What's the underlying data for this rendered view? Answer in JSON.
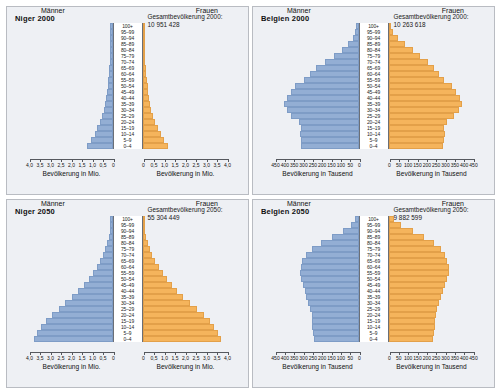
{
  "panels": [
    {
      "id": "niger-2000",
      "title": "Niger 2000",
      "total_label": "Gesamtbevölkerung 2000:\n10 951 428",
      "male_label": "Männer",
      "female_label": "Frauen",
      "axis_title": "Bevölkerung in Mio.",
      "unit": "Mio.",
      "axis_max": 4.0,
      "ticks": [
        "4,0",
        "3,5",
        "3,0",
        "2,5",
        "2,0",
        "1,5",
        "1,0",
        "0,5",
        "0"
      ],
      "tick_values": [
        4.0,
        3.5,
        3.0,
        2.5,
        2.0,
        1.5,
        1.0,
        0.5,
        0
      ]
    },
    {
      "id": "belgien-2000",
      "title": "Belgien 2000",
      "total_label": "Gesamtbevölkerung 2000:\n10 263 618",
      "male_label": "Männer",
      "female_label": "Frauen",
      "axis_title": "Bevölkerung in Tausend",
      "unit": "Tausend",
      "axis_max": 450,
      "ticks": [
        "450",
        "400",
        "350",
        "300",
        "250",
        "200",
        "150",
        "100",
        "50",
        "0"
      ],
      "tick_values": [
        450,
        400,
        350,
        300,
        250,
        200,
        150,
        100,
        50,
        0
      ]
    },
    {
      "id": "niger-2050",
      "title": "Niger 2050",
      "total_label": "Gesamtbevölkerung 2050:\n55 304 449",
      "male_label": "Männer",
      "female_label": "Frauen",
      "axis_title": "Bevölkerung in Mio.",
      "unit": "Mio.",
      "axis_max": 4.0,
      "ticks": [
        "4,0",
        "3,5",
        "3,0",
        "2,5",
        "2,0",
        "1,5",
        "1,0",
        "0,5",
        "0"
      ],
      "tick_values": [
        4.0,
        3.5,
        3.0,
        2.5,
        2.0,
        1.5,
        1.0,
        0.5,
        0
      ]
    },
    {
      "id": "belgien-2050",
      "title": "Belgien 2050",
      "total_label": "Gesamtbevölkerung 2050:\n9 882 599",
      "male_label": "Männer",
      "female_label": "Frauen",
      "axis_title": "Bevölkerung in Tausend",
      "unit": "Tausend",
      "axis_max": 450,
      "ticks": [
        "450",
        "400",
        "350",
        "300",
        "250",
        "200",
        "150",
        "100",
        "50",
        "0"
      ],
      "tick_values": [
        450,
        400,
        350,
        300,
        250,
        200,
        150,
        100,
        50,
        0
      ]
    }
  ],
  "age_groups": [
    "100+",
    "95–99",
    "90–94",
    "85–89",
    "80–84",
    "75–79",
    "70–74",
    "65–69",
    "60–64",
    "55–59",
    "50–54",
    "45–49",
    "40–44",
    "35–39",
    "30–34",
    "25–29",
    "20–24",
    "15–19",
    "10–14",
    "5–9",
    "0–4"
  ],
  "colors": {
    "male_bar": "#93aed4",
    "female_bar": "#f5b45c",
    "panel_background": "#eef0f4",
    "panel_border": "#b9bcc2",
    "axis": "#55585e",
    "page_background": "#ffffff"
  },
  "chart_data": [
    {
      "type": "bar",
      "id": "niger-2000",
      "title": "Niger 2000",
      "subtitle": "Gesamtbevölkerung 2000: 10 951 428",
      "orientation": "population-pyramid",
      "xlabel": "Bevölkerung in Mio.",
      "ylabel": "Altersgruppe",
      "xlim": [
        0,
        4.0
      ],
      "unit": "Millionen",
      "grid": false,
      "legend_position": "inline-left-right",
      "categories": [
        "100+",
        "95–99",
        "90–94",
        "85–89",
        "80–84",
        "75–79",
        "70–74",
        "65–69",
        "60–64",
        "55–59",
        "50–54",
        "45–49",
        "40–44",
        "35–39",
        "30–34",
        "25–29",
        "20–24",
        "15–19",
        "10–14",
        "5–9",
        "0–4"
      ],
      "series": [
        {
          "name": "Männer",
          "side": "left",
          "values": [
            0.001,
            0.002,
            0.005,
            0.01,
            0.019,
            0.031,
            0.046,
            0.064,
            0.086,
            0.112,
            0.142,
            0.176,
            0.216,
            0.262,
            0.318,
            0.392,
            0.489,
            0.62,
            0.76,
            0.93,
            1.1
          ]
        },
        {
          "name": "Frauen",
          "side": "right",
          "values": [
            0.001,
            0.002,
            0.005,
            0.011,
            0.02,
            0.032,
            0.047,
            0.065,
            0.087,
            0.113,
            0.144,
            0.179,
            0.22,
            0.266,
            0.323,
            0.398,
            0.496,
            0.628,
            0.768,
            0.94,
            1.11
          ]
        }
      ]
    },
    {
      "type": "bar",
      "id": "belgien-2000",
      "title": "Belgien 2000",
      "subtitle": "Gesamtbevölkerung 2000: 10 263 618",
      "orientation": "population-pyramid",
      "xlabel": "Bevölkerung in Tausend",
      "ylabel": "Altersgruppe",
      "xlim": [
        0,
        450
      ],
      "unit": "Tausend",
      "grid": false,
      "legend_position": "inline-left-right",
      "categories": [
        "100+",
        "95–99",
        "90–94",
        "85–89",
        "80–84",
        "75–79",
        "70–74",
        "65–69",
        "60–64",
        "55–59",
        "50–54",
        "45–49",
        "40–44",
        "35–39",
        "30–34",
        "25–29",
        "20–24",
        "15–19",
        "10–14",
        "5–9",
        "0–4"
      ],
      "series": [
        {
          "name": "Männer",
          "side": "left",
          "values": [
            1,
            6,
            18,
            44,
            78,
            120,
            170,
            215,
            250,
            282,
            330,
            352,
            375,
            390,
            372,
            350,
            310,
            300,
            305,
            300,
            295
          ]
        },
        {
          "name": "Frauen",
          "side": "right",
          "values": [
            4,
            16,
            42,
            78,
            122,
            160,
            200,
            232,
            258,
            288,
            332,
            350,
            372,
            385,
            365,
            342,
            300,
            288,
            292,
            288,
            282
          ]
        }
      ]
    },
    {
      "type": "bar",
      "id": "niger-2050",
      "title": "Niger 2050",
      "subtitle": "Gesamtbevölkerung 2050: 55 304 449",
      "orientation": "population-pyramid",
      "xlabel": "Bevölkerung in Mio.",
      "ylabel": "Altersgruppe",
      "xlim": [
        0,
        4.0
      ],
      "unit": "Millionen",
      "grid": false,
      "legend_position": "inline-left-right",
      "categories": [
        "100+",
        "95–99",
        "90–94",
        "85–89",
        "80–84",
        "75–79",
        "70–74",
        "65–69",
        "60–64",
        "55–59",
        "50–54",
        "45–49",
        "40–44",
        "35–39",
        "30–34",
        "25–29",
        "20–24",
        "15–19",
        "10–14",
        "5–9",
        "0–4"
      ],
      "series": [
        {
          "name": "Männer",
          "side": "left",
          "values": [
            0.004,
            0.015,
            0.04,
            0.085,
            0.15,
            0.24,
            0.36,
            0.5,
            0.66,
            0.84,
            1.04,
            1.27,
            1.53,
            1.83,
            2.15,
            2.47,
            2.8,
            3.08,
            3.3,
            3.48,
            3.62
          ]
        },
        {
          "name": "Frauen",
          "side": "right",
          "values": [
            0.005,
            0.018,
            0.046,
            0.094,
            0.162,
            0.255,
            0.378,
            0.52,
            0.682,
            0.865,
            1.065,
            1.295,
            1.555,
            1.855,
            2.175,
            2.495,
            2.82,
            3.1,
            3.315,
            3.49,
            3.63
          ]
        }
      ]
    },
    {
      "type": "bar",
      "id": "belgien-2050",
      "title": "Belgien 2050",
      "subtitle": "Gesamtbevölkerung 2050: 9 882 599",
      "orientation": "population-pyramid",
      "xlabel": "Bevölkerung in Tausend",
      "ylabel": "Altersgruppe",
      "xlim": [
        0,
        450
      ],
      "unit": "Tausend",
      "grid": false,
      "legend_position": "inline-left-right",
      "categories": [
        "100+",
        "95–99",
        "90–94",
        "85–89",
        "80–84",
        "75–79",
        "70–74",
        "65–69",
        "60–64",
        "55–59",
        "50–54",
        "45–49",
        "40–44",
        "35–39",
        "30–34",
        "25–29",
        "20–24",
        "15–19",
        "10–14",
        "5–9",
        "0–4"
      ],
      "series": [
        {
          "name": "Männer",
          "side": "left",
          "values": [
            6,
            28,
            70,
            132,
            190,
            240,
            272,
            292,
            300,
            305,
            298,
            288,
            278,
            268,
            258,
            248,
            240,
            238,
            236,
            232,
            228
          ]
        },
        {
          "name": "Frauen",
          "side": "right",
          "values": [
            18,
            58,
            118,
            182,
            235,
            272,
            292,
            305,
            312,
            315,
            302,
            290,
            280,
            270,
            260,
            250,
            242,
            238,
            236,
            232,
            226
          ]
        }
      ]
    }
  ]
}
